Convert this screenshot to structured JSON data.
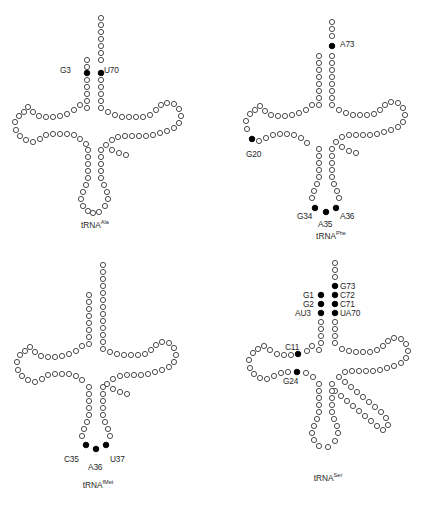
{
  "figure": {
    "type": "tRNA cloverleaf secondary structure diagrams",
    "panel_count": 4,
    "legend_note": "Open circles denote nucleotides; filled black circles denote identity elements",
    "colors": {
      "open_circle_fill": "#ffffff",
      "open_circle_stroke": "#3a3a3a",
      "filled_circle": "#000000",
      "text": "#1f1f1f",
      "background": "#ffffff"
    }
  },
  "panels": [
    {
      "id": "trna-ala",
      "name_base": "tRNA",
      "name_sup": "Ala",
      "labels": [
        {
          "text": "G3",
          "x": 60,
          "y": 66
        },
        {
          "text": "U70",
          "x": 104,
          "y": 66
        }
      ],
      "filled_residues": [
        "G3",
        "U70"
      ]
    },
    {
      "id": "trna-phe",
      "name_base": "tRNA",
      "name_sup": "Phe",
      "labels": [
        {
          "text": "A73",
          "x": 340,
          "y": 40
        },
        {
          "text": "G20",
          "x": 246,
          "y": 150
        },
        {
          "text": "G34",
          "x": 297,
          "y": 212
        },
        {
          "text": "A35",
          "x": 318,
          "y": 220
        },
        {
          "text": "A36",
          "x": 340,
          "y": 212
        }
      ],
      "filled_residues": [
        "A73",
        "G20",
        "G34",
        "A35",
        "A36"
      ]
    },
    {
      "id": "trna-fmet",
      "name_base": "tRNA",
      "name_sup": "fMet",
      "labels": [
        {
          "text": "C35",
          "x": 64,
          "y": 455
        },
        {
          "text": "A36",
          "x": 85,
          "y": 463
        },
        {
          "text": "U37",
          "x": 107,
          "y": 455
        }
      ],
      "filled_residues": [
        "C35",
        "A36",
        "U37"
      ]
    },
    {
      "id": "trna-ser",
      "name_base": "tRNA",
      "name_sup": "Ser",
      "labels": [
        {
          "text": "G73",
          "x": 338,
          "y": 285
        },
        {
          "text": "G1",
          "x": 299,
          "y": 295
        },
        {
          "text": "C72",
          "x": 338,
          "y": 295
        },
        {
          "text": "G2",
          "x": 299,
          "y": 304
        },
        {
          "text": "C71",
          "x": 338,
          "y": 304
        },
        {
          "text": "AU3",
          "x": 291,
          "y": 313
        },
        {
          "text": "UA70",
          "x": 338,
          "y": 313
        },
        {
          "text": "C11",
          "x": 285,
          "y": 343
        },
        {
          "text": "G24",
          "x": 283,
          "y": 372
        }
      ],
      "filled_residues": [
        "G73",
        "G1",
        "C72",
        "G2",
        "C71",
        "AU3",
        "UA70",
        "C11",
        "G24"
      ]
    }
  ],
  "caption_fragment": ""
}
